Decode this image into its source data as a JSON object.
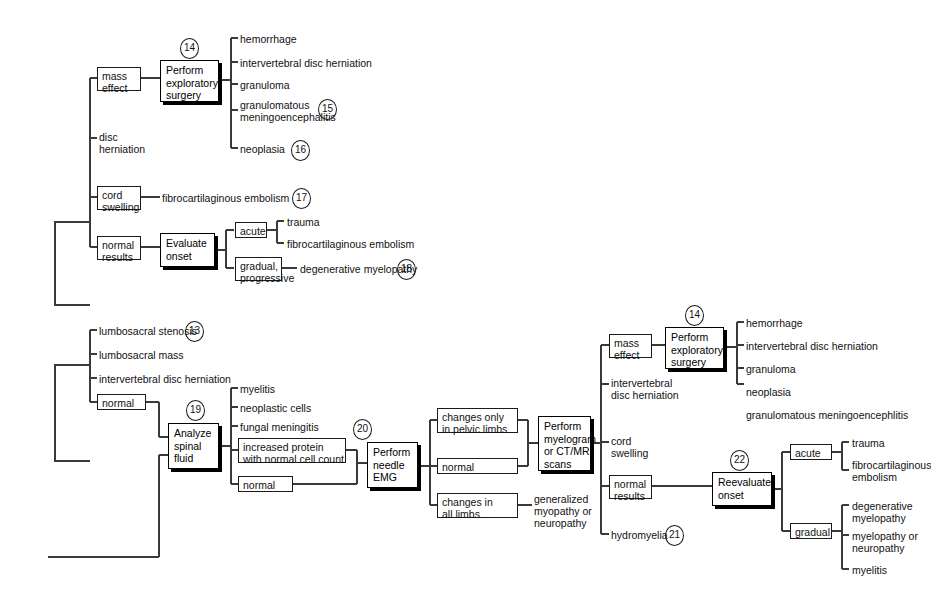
{
  "diagram": {
    "line_color": "#3a3a3a",
    "box_border_color": "#1a1a1a",
    "action_border_color": "#000000",
    "background": "#ffffff"
  },
  "top_tree": {
    "branch_labels": {
      "mass_effect": "mass\neffect",
      "disc_herniation": "disc\nherniation",
      "cord_swelling": "cord\nswelling",
      "normal_results": "normal\nresults"
    },
    "actions": {
      "exploratory_surgery": "Perform\nexploratory\nsurgery",
      "exploratory_surgery_num": "14",
      "evaluate_onset": "Evaluate\nonset",
      "evaluate_onset_num": ""
    },
    "surgery_outcomes": [
      {
        "label": "hemorrhage",
        "num": ""
      },
      {
        "label": "intervertebral disc herniation",
        "num": ""
      },
      {
        "label": "granuloma",
        "num": ""
      },
      {
        "label": "granulomatous\nmeningoencephalitis",
        "num": "15"
      },
      {
        "label": "neoplasia",
        "num": "16"
      }
    ],
    "cord_swelling_outcome": {
      "label": "fibrocartilaginous embolism",
      "num": "17"
    },
    "onset": {
      "acute": "acute",
      "acute_outcomes": [
        "trauma",
        "fibrocartilaginous embolism"
      ],
      "gradual": "gradual,\nprogressive",
      "gradual_outcome": {
        "label": "degenerative myelopathy",
        "num": "18"
      }
    }
  },
  "bottom_tree": {
    "first_level": [
      {
        "label": "lumbosacral stenosis",
        "num": "13"
      },
      {
        "label": "lumbosacral mass",
        "num": ""
      },
      {
        "label": "intervertebral disc herniation",
        "num": ""
      }
    ],
    "normal_box": "normal",
    "analyze": {
      "label": "Analyze\nspinal\nfluid",
      "num": "19"
    },
    "csf_results": [
      {
        "label": "myelitis",
        "boxed": false
      },
      {
        "label": "neoplastic cells",
        "boxed": false
      },
      {
        "label": "fungal meningitis",
        "boxed": false
      },
      {
        "label": "increased protein\nwith normal cell count",
        "boxed": true
      },
      {
        "label": "normal",
        "boxed": true
      }
    ],
    "emg": {
      "label": "Perform\nneedle\nEMG",
      "num": "20"
    },
    "emg_results": [
      {
        "label": "changes only\nin pelvic limbs",
        "boxed": true
      },
      {
        "label": "normal",
        "boxed": true
      },
      {
        "label": "changes in\nall limbs",
        "boxed": true
      }
    ],
    "emg_all_limbs_outcome": "generalized\nmyopathy or\nneuropathy",
    "myelogram": {
      "label": "Perform\nmyelogram\nor CT/MRI\nscans",
      "num": ""
    },
    "myelogram_results": {
      "mass_effect": "mass\neffect",
      "disc_herniation": "intervertebral\ndisc herniation",
      "cord_swelling": "cord\nswelling",
      "normal_results": "normal\nresults",
      "hydromyelia": {
        "label": "hydromyelia",
        "num": "21"
      }
    },
    "surgery2": {
      "label": "Perform\nexploratory\nsurgery",
      "num": "14"
    },
    "surgery2_outcomes": [
      "hemorrhage",
      "intervertebral disc herniation",
      "granuloma",
      "neoplasia",
      "granulomatous meningoencephlitis"
    ],
    "reevaluate": {
      "label": "Reevaluate\nonset",
      "num": "22"
    },
    "reevaluate_branches": {
      "acute": "acute",
      "acute_outcomes": [
        "trauma",
        "fibrocartilaginous\nembolism"
      ],
      "gradual": "gradual",
      "gradual_outcomes": [
        "degenerative\nmyelopathy",
        "myelopathy or\nneuropathy",
        "myelitis"
      ]
    }
  }
}
